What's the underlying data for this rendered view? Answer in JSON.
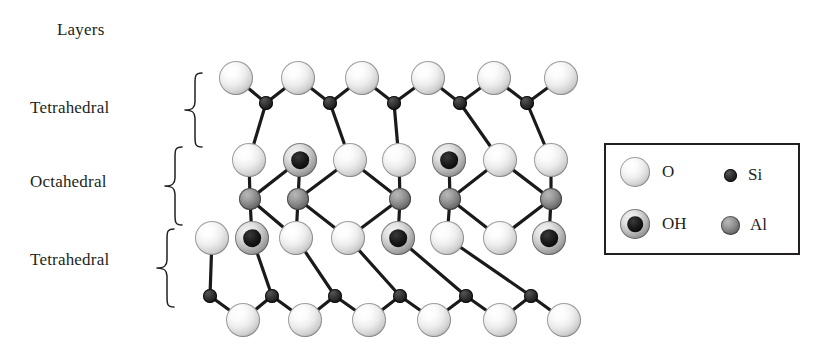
{
  "title": "Layers",
  "layer_labels": [
    {
      "id": "tetrahedral-top",
      "text": "Tetrahedral"
    },
    {
      "id": "octahedral",
      "text": "Octahedral"
    },
    {
      "id": "tetrahedral-bottom",
      "text": "Tetrahedral"
    }
  ],
  "legend": {
    "items": [
      {
        "symbol": "O",
        "kind": "oxygen",
        "size": 30
      },
      {
        "symbol": "Si",
        "kind": "silicon",
        "size": 13
      },
      {
        "symbol": "OH",
        "kind": "hydroxyl",
        "size": 30
      },
      {
        "symbol": "Al",
        "kind": "aluminium",
        "size": 19
      }
    ]
  },
  "colors": {
    "ink": "#231f20",
    "oxygen_light": "#f2f2f2",
    "hydroxyl_core": "#000000",
    "aluminium": "#7a7a7a",
    "silicon": "#1a1a1a",
    "background": "#ffffff"
  },
  "structure": {
    "description": "2:1 clay mineral layer: tetrahedral - octahedral - tetrahedral",
    "rows": [
      {
        "name": "top-oxygen-row",
        "y": 78,
        "atoms": [
          {
            "kind": "O",
            "x": 236,
            "r": 17
          },
          {
            "kind": "O",
            "x": 298,
            "r": 17
          },
          {
            "kind": "O",
            "x": 362,
            "r": 17
          },
          {
            "kind": "O",
            "x": 428,
            "r": 17
          },
          {
            "kind": "O",
            "x": 494,
            "r": 17
          },
          {
            "kind": "O",
            "x": 561,
            "r": 17
          }
        ]
      },
      {
        "name": "top-silicon-row",
        "y": 103,
        "atoms": [
          {
            "kind": "Si",
            "x": 266,
            "r": 7
          },
          {
            "kind": "Si",
            "x": 330,
            "r": 7
          },
          {
            "kind": "Si",
            "x": 394,
            "r": 7
          },
          {
            "kind": "Si",
            "x": 460,
            "r": 7
          },
          {
            "kind": "Si",
            "x": 527,
            "r": 7
          }
        ]
      },
      {
        "name": "upper-inner-row",
        "y": 160,
        "atoms": [
          {
            "kind": "O",
            "x": 249,
            "r": 17
          },
          {
            "kind": "OH",
            "x": 300,
            "r": 17
          },
          {
            "kind": "O",
            "x": 350,
            "r": 17
          },
          {
            "kind": "O",
            "x": 399,
            "r": 17
          },
          {
            "kind": "OH",
            "x": 449,
            "r": 17
          },
          {
            "kind": "O",
            "x": 500,
            "r": 17
          },
          {
            "kind": "O",
            "x": 551,
            "r": 17
          }
        ]
      },
      {
        "name": "aluminium-row",
        "y": 199,
        "atoms": [
          {
            "kind": "Al",
            "x": 250,
            "r": 11
          },
          {
            "kind": "Al",
            "x": 298,
            "r": 11
          },
          {
            "kind": "Al",
            "x": 400,
            "r": 11
          },
          {
            "kind": "Al",
            "x": 450,
            "r": 11
          },
          {
            "kind": "Al",
            "x": 551,
            "r": 11
          }
        ]
      },
      {
        "name": "lower-inner-row",
        "y": 238,
        "atoms": [
          {
            "kind": "O",
            "x": 212,
            "r": 17
          },
          {
            "kind": "OH",
            "x": 252,
            "r": 17
          },
          {
            "kind": "O",
            "x": 296,
            "r": 17
          },
          {
            "kind": "O",
            "x": 348,
            "r": 17
          },
          {
            "kind": "OH",
            "x": 398,
            "r": 17
          },
          {
            "kind": "O",
            "x": 447,
            "r": 17
          },
          {
            "kind": "O",
            "x": 500,
            "r": 17
          },
          {
            "kind": "OH",
            "x": 549,
            "r": 17
          }
        ]
      },
      {
        "name": "bottom-silicon-row",
        "y": 296,
        "atoms": [
          {
            "kind": "Si",
            "x": 210,
            "r": 7
          },
          {
            "kind": "Si",
            "x": 272,
            "r": 7
          },
          {
            "kind": "Si",
            "x": 335,
            "r": 7
          },
          {
            "kind": "Si",
            "x": 400,
            "r": 7
          },
          {
            "kind": "Si",
            "x": 466,
            "r": 7
          },
          {
            "kind": "Si",
            "x": 531,
            "r": 7
          }
        ]
      },
      {
        "name": "bottom-oxygen-row",
        "y": 320,
        "atoms": [
          {
            "kind": "O",
            "x": 243,
            "r": 17
          },
          {
            "kind": "O",
            "x": 305,
            "r": 17
          },
          {
            "kind": "O",
            "x": 369,
            "r": 17
          },
          {
            "kind": "O",
            "x": 434,
            "r": 17
          },
          {
            "kind": "O",
            "x": 500,
            "r": 17
          },
          {
            "kind": "O",
            "x": 564,
            "r": 17
          }
        ]
      }
    ]
  }
}
